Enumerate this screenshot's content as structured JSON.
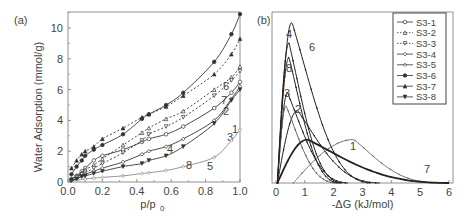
{
  "figure": {
    "panel_a_label": "(a)",
    "panel_b_label": "(b)"
  },
  "chart_data": [
    {
      "panel": "(a)",
      "type": "line",
      "title": "",
      "xlabel": "p/p0",
      "ylabel": "Water Adsorption (mmol/g)",
      "xlim": [
        0.0,
        1.0
      ],
      "ylim": [
        0,
        11
      ],
      "xticks": [
        "0.0",
        "0.2",
        "0.4",
        "0.6",
        "0.8",
        "1.0"
      ],
      "yticks": [
        "0",
        "2",
        "4",
        "6",
        "8",
        "10"
      ],
      "grid": false,
      "series": [
        {
          "name": "S3-1",
          "label": "1",
          "dash": false,
          "marker": "circle-open",
          "x": [
            0.02,
            0.05,
            0.08,
            0.1,
            0.15,
            0.2,
            0.32,
            0.43,
            0.47,
            0.57,
            0.67,
            0.85,
            0.95,
            1.0
          ],
          "y": [
            0.2,
            0.4,
            0.7,
            0.9,
            1.4,
            1.7,
            2.1,
            2.6,
            2.8,
            3.1,
            3.6,
            4.8,
            5.8,
            6.5
          ]
        },
        {
          "name": "S3-2",
          "label": "2",
          "dash": true,
          "marker": "triangle-open",
          "x": [
            0.02,
            0.05,
            0.08,
            0.1,
            0.15,
            0.2,
            0.32,
            0.43,
            0.47,
            0.57,
            0.67,
            0.85,
            0.95,
            1.0
          ],
          "y": [
            0.2,
            0.4,
            0.6,
            0.8,
            1.1,
            1.5,
            2.4,
            3.2,
            3.5,
            4.1,
            4.6,
            6.0,
            6.8,
            7.5
          ]
        },
        {
          "name": "S3-3",
          "label": "3",
          "dash": true,
          "marker": "triangle-down-open",
          "x": [
            0.02,
            0.05,
            0.08,
            0.1,
            0.15,
            0.2,
            0.32,
            0.43,
            0.47,
            0.57,
            0.67,
            0.85,
            0.95,
            1.0
          ],
          "y": [
            0.1,
            0.3,
            0.5,
            0.6,
            0.9,
            1.2,
            1.9,
            2.7,
            3.1,
            3.6,
            4.2,
            5.6,
            6.6,
            7.2
          ]
        },
        {
          "name": "S3-4",
          "label": "4",
          "dash": false,
          "marker": "diamond-open",
          "x": [
            0.02,
            0.05,
            0.08,
            0.1,
            0.15,
            0.2,
            0.32,
            0.43,
            0.47,
            0.57,
            0.67,
            0.85,
            0.95,
            1.0
          ],
          "y": [
            0.1,
            0.2,
            0.4,
            0.5,
            0.7,
            0.9,
            1.3,
            1.8,
            2.0,
            2.3,
            2.8,
            4.0,
            5.4,
            6.2
          ]
        },
        {
          "name": "S3-5",
          "label": "5",
          "dash": false,
          "marker": "star-open",
          "x": [
            0.05,
            0.1,
            0.15,
            0.2,
            0.32,
            0.43,
            0.47,
            0.57,
            0.67,
            0.85,
            0.95,
            1.0
          ],
          "y": [
            0.1,
            0.2,
            0.25,
            0.3,
            0.4,
            0.55,
            0.6,
            0.75,
            1.0,
            1.6,
            2.7,
            3.4
          ]
        },
        {
          "name": "S3-6",
          "label": "6",
          "dash": false,
          "marker": "circle-half",
          "x": [
            0.02,
            0.05,
            0.08,
            0.1,
            0.15,
            0.2,
            0.32,
            0.43,
            0.47,
            0.57,
            0.67,
            0.85,
            0.95,
            1.0
          ],
          "y": [
            0.5,
            1.0,
            1.4,
            1.7,
            2.1,
            2.4,
            3.1,
            4.1,
            4.4,
            5.0,
            5.8,
            7.8,
            9.6,
            11.0
          ]
        },
        {
          "name": "S3-7",
          "label": "7",
          "dash": true,
          "marker": "triangle-filled",
          "x": [
            0.02,
            0.05,
            0.08,
            0.1,
            0.15,
            0.2,
            0.32,
            0.43,
            0.47,
            0.57,
            0.67,
            0.85,
            0.95,
            1.0
          ],
          "y": [
            0.9,
            1.4,
            1.8,
            2.0,
            2.3,
            2.8,
            3.5,
            4.2,
            4.4,
            4.9,
            5.6,
            7.0,
            8.3,
            9.3
          ]
        },
        {
          "name": "S3-8",
          "label": "8",
          "dash": false,
          "marker": "triangle-down-filled",
          "x": [
            0.02,
            0.05,
            0.08,
            0.1,
            0.15,
            0.2,
            0.32,
            0.43,
            0.47,
            0.57,
            0.67,
            0.85,
            0.95,
            1.0
          ],
          "y": [
            0.1,
            0.2,
            0.35,
            0.4,
            0.55,
            0.7,
            1.0,
            1.2,
            1.4,
            1.7,
            2.3,
            3.8,
            5.3,
            6.0
          ]
        }
      ]
    },
    {
      "panel": "(b)",
      "type": "line",
      "title": "",
      "xlabel": "-ΔG (kJ/mol)",
      "ylabel": "",
      "xlim": [
        0,
        6
      ],
      "ylim": [
        0,
        1
      ],
      "xticks": [
        "0",
        "1",
        "2",
        "3",
        "4",
        "5",
        "6"
      ],
      "yticks": [],
      "grid": false,
      "legend_position": "upper right",
      "legend": [
        "S3-1",
        "S3-2",
        "S3-3",
        "S3-4",
        "S3-5",
        "S3-6",
        "S3-7",
        "S3-8"
      ],
      "series": [
        {
          "name": "S3-1",
          "label": "1",
          "peak_x": 2.7,
          "peak_y": 0.27,
          "end_x": 5.7
        },
        {
          "name": "S3-2",
          "label": "2",
          "peak_x": 0.75,
          "peak_y": 0.45,
          "end_x": 3.6
        },
        {
          "name": "S3-3",
          "label": "3",
          "peak_x": 0.4,
          "peak_y": 0.56,
          "end_x": 2.5
        },
        {
          "name": "S3-4",
          "label": "4",
          "peak_x": 0.45,
          "peak_y": 0.87,
          "end_x": 2.3
        },
        {
          "name": "S3-5",
          "label": "5",
          "peak_x": 0.35,
          "peak_y": 0.48,
          "end_x": 2.1
        },
        {
          "name": "S3-6",
          "label": "6",
          "peak_x": 0.55,
          "peak_y": 1.0,
          "end_x": 3.3
        },
        {
          "name": "S3-7",
          "label": "7",
          "peak_x": 1.1,
          "peak_y": 0.27,
          "end_x": 6.0
        },
        {
          "name": "S3-8",
          "label": "8",
          "peak_x": 0.45,
          "peak_y": 0.78,
          "end_x": 2.2
        }
      ],
      "annotations": [
        "1",
        "2",
        "3",
        "4",
        "6",
        "7",
        "8"
      ]
    }
  ]
}
